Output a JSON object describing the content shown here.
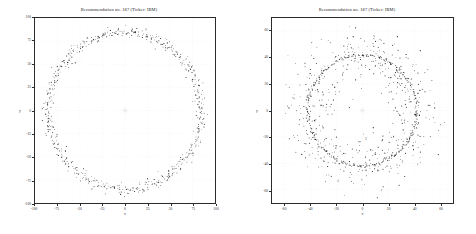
{
  "figure": {
    "background_color": "#ffffff",
    "frame_color": "#2b2b2b",
    "point_color": "#1c1c1c",
    "panel_count": 2
  },
  "chart_data": [
    {
      "type": "scatter",
      "panel": "left",
      "title": "Recommendation no. 187  (Ticker: IBM)",
      "xlabel": "x",
      "ylabel": "y",
      "xlim": [
        -100,
        100
      ],
      "ylim": [
        -100,
        100
      ],
      "xticks": [
        -100,
        -75,
        -50,
        -25,
        0,
        25,
        50,
        75,
        100
      ],
      "yticks": [
        -100,
        -75,
        -50,
        -25,
        0,
        25,
        50,
        75,
        100
      ],
      "xticklabels": [
        "-100",
        "-75",
        "-50",
        "-25",
        "0",
        "25",
        "50",
        "75",
        "100"
      ],
      "yticklabels": [
        "-100",
        "-75",
        "-50",
        "-25",
        "0",
        "25",
        "50",
        "75",
        "100"
      ],
      "grid": false,
      "legend": null,
      "marker": "point",
      "marker_size": 0.8,
      "description": "Dense annular point cloud forming a near-perfect circle centred at the origin.",
      "ring": {
        "center": [
          0,
          0
        ],
        "radius": 85,
        "radial_noise_sigma": 3.0,
        "n_points": 620
      },
      "center_marker": {
        "x": 0,
        "y": 0,
        "label": ""
      }
    },
    {
      "type": "scatter",
      "panel": "right",
      "title": "Recommendation no. 187  (Ticker: IBM)",
      "xlabel": "x",
      "ylabel": "y",
      "xlim": [
        -70,
        70
      ],
      "ylim": [
        -70,
        70
      ],
      "xticks": [
        -60,
        -40,
        -20,
        0,
        20,
        40,
        60
      ],
      "yticks": [
        -60,
        -40,
        -20,
        0,
        20,
        40,
        60
      ],
      "xticklabels": [
        "-60",
        "-40",
        "-20",
        "0",
        "20",
        "40",
        "60"
      ],
      "yticklabels": [
        "-60",
        "-40",
        "-20",
        "0",
        "20",
        "40",
        "60"
      ],
      "grid": false,
      "legend": null,
      "marker": "point",
      "marker_size": 0.8,
      "description": "Sharp circle of radius 42 overlaid by a much broader, diffuse scatter cloud extending beyond the ring.",
      "ring": {
        "center": [
          0,
          0
        ],
        "radius": 42,
        "radial_noise_sigma": 0.55,
        "n_points": 300
      },
      "cloud": {
        "center": [
          0,
          0
        ],
        "radius": 42,
        "radial_noise_sigma": 10.0,
        "n_points": 560
      },
      "center_marker": {
        "x": 0,
        "y": 0,
        "label": ""
      },
      "inner_label": {
        "x": 2,
        "y": -22,
        "text": "1"
      }
    }
  ]
}
